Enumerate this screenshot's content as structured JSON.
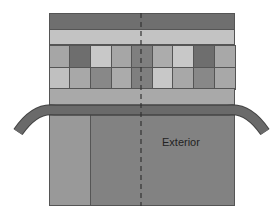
{
  "diagram": {
    "label": "Exterior",
    "colors": {
      "dark_band": "#6f6f6f",
      "light_band": "#c3c3c3",
      "outline": "#555555",
      "strip": "#6a6a6a",
      "left_panel": "#999999",
      "main_panel": "#828282"
    },
    "grid": {
      "rows": [
        [
          "#a6a6a6",
          "#6e6e6e",
          "#c8c8c8",
          "#a6a6a6",
          "#7f7f7f",
          "#acacac",
          "#c8c8c8",
          "#6e6e6e",
          "#a8a8a8"
        ],
        [
          "#c0c0c0",
          "#a8a8a8",
          "#888888",
          "#ababab",
          "#7f7f7f",
          "#c8c8c8",
          "#a8a8a8",
          "#888888",
          "#a8a8a8"
        ]
      ]
    }
  }
}
